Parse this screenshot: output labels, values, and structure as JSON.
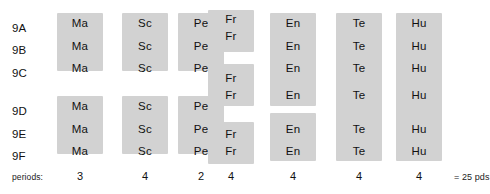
{
  "colors": {
    "block_fill": "#d2d2d2",
    "background": "#ffffff",
    "text": "#111111"
  },
  "grid": {
    "row_labels": [
      "9A",
      "9B",
      "9C",
      "9D",
      "9E",
      "9F"
    ],
    "row_tops": [
      23,
      45,
      68,
      106,
      129,
      151
    ],
    "column_lefts": [
      57,
      122,
      178,
      208,
      270,
      336,
      396
    ],
    "column_width": 46
  },
  "columns": [
    {
      "key": "ma",
      "subject": "Ma",
      "periods": "3",
      "left": 57,
      "blocks": [
        {
          "top": 13,
          "height": 58,
          "labels": [
            "Ma",
            "Ma",
            "Ma"
          ],
          "label_tops": [
            18,
            41,
            63
          ]
        },
        {
          "top": 96,
          "height": 58,
          "labels": [
            "Ma",
            "Ma",
            "Ma"
          ],
          "label_tops": [
            101,
            124,
            146
          ]
        }
      ]
    },
    {
      "key": "sc",
      "subject": "Sc",
      "periods": "4",
      "left": 122,
      "blocks": [
        {
          "top": 13,
          "height": 58,
          "labels": [
            "Sc",
            "Sc",
            "Sc"
          ],
          "label_tops": [
            18,
            41,
            63
          ]
        },
        {
          "top": 96,
          "height": 58,
          "labels": [
            "Sc",
            "Sc",
            "Sc"
          ],
          "label_tops": [
            101,
            124,
            146
          ]
        }
      ]
    },
    {
      "key": "pe",
      "subject": "Pe",
      "periods": "2",
      "left": 178,
      "blocks": [
        {
          "top": 13,
          "height": 58,
          "labels": [
            "Pe",
            "Pe",
            "Pe"
          ],
          "label_tops": [
            18,
            41,
            63
          ]
        },
        {
          "top": 96,
          "height": 58,
          "labels": [
            "Pe",
            "Pe",
            "Pe"
          ],
          "label_tops": [
            101,
            124,
            146
          ]
        }
      ]
    },
    {
      "key": "fr",
      "subject": "Fr",
      "periods": "4",
      "left": 208,
      "blocks": [
        {
          "top": 10,
          "height": 42,
          "labels": [
            "Fr",
            "Fr"
          ],
          "label_tops": [
            14,
            31
          ]
        },
        {
          "top": 64,
          "height": 42,
          "labels": [
            "Fr",
            "Fr"
          ],
          "label_tops": [
            73,
            90
          ]
        },
        {
          "top": 122,
          "height": 42,
          "labels": [
            "Fr",
            "Fr"
          ],
          "label_tops": [
            129,
            146
          ]
        }
      ]
    },
    {
      "key": "en",
      "subject": "En",
      "periods": "4",
      "left": 270,
      "blocks": [
        {
          "top": 13,
          "height": 93,
          "labels": [
            "En",
            "En",
            "En",
            "En"
          ],
          "label_tops": [
            18,
            41,
            63,
            90
          ]
        },
        {
          "top": 113,
          "height": 48,
          "labels": [
            "En",
            "En"
          ],
          "label_tops": [
            124,
            146
          ]
        }
      ]
    },
    {
      "key": "te",
      "subject": "Te",
      "periods": "4",
      "left": 336,
      "blocks": [
        {
          "top": 13,
          "height": 148,
          "labels": [
            "Te",
            "Te",
            "Te",
            "Te",
            "Te",
            "Te"
          ],
          "label_tops": [
            18,
            41,
            63,
            90,
            124,
            146
          ]
        }
      ]
    },
    {
      "key": "hu",
      "subject": "Hu",
      "periods": "4",
      "left": 396,
      "blocks": [
        {
          "top": 13,
          "height": 148,
          "labels": [
            "Hu",
            "Hu",
            "Hu",
            "Hu",
            "Hu",
            "Hu"
          ],
          "label_tops": [
            18,
            41,
            63,
            90,
            124,
            146
          ]
        }
      ]
    }
  ],
  "footer": {
    "label": "periods:",
    "counts": [
      "3",
      "4",
      "2",
      "4",
      "4",
      "4",
      "4"
    ],
    "total": "= 25 pds"
  }
}
